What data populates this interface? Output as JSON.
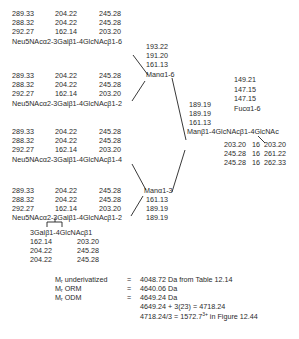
{
  "antennae": [
    {
      "rows": [
        [
          "289.33",
          "204.22",
          "245.28"
        ],
        [
          "288.32",
          "204.22",
          "245.28"
        ],
        [
          "292.27",
          "162.14",
          "203.20"
        ]
      ],
      "label": "Neu5NAcα2-3Galβ1-4GlcNAcβ1-6"
    },
    {
      "rows": [
        [
          "289.33",
          "204.22",
          "245.28"
        ],
        [
          "288.32",
          "204.22",
          "245.28"
        ],
        [
          "292.27",
          "162.14",
          "203.20"
        ]
      ],
      "label": "Neu5NAcα2-3Galβ1-4GlcNAcβ1-2"
    },
    {
      "rows": [
        [
          "289.33",
          "204.22",
          "245.28"
        ],
        [
          "288.32",
          "204.22",
          "245.28"
        ],
        [
          "292.27",
          "162.14",
          "203.20"
        ]
      ],
      "label": "Neu5NAcα2-3Galβ1-4GlcNAcβ1-4"
    },
    {
      "rows": [
        [
          "289.33",
          "204.22",
          "245.28"
        ],
        [
          "288.32",
          "204.22",
          "245.28"
        ],
        [
          "292.27",
          "162.14",
          "203.20"
        ]
      ],
      "label": "Neu5NAcα2-3Galβ1-4GlcNAcβ1-2"
    }
  ],
  "branch_upper": {
    "values": [
      "193.22",
      "191.20",
      "161.13"
    ],
    "label": "Manα1-6"
  },
  "branch_lower": {
    "label": "Manα1-3",
    "values": [
      "161.13",
      "189.19",
      "189.19"
    ]
  },
  "core": {
    "values": [
      "189.19",
      "189.19",
      "161.13"
    ],
    "label": "Manβ1-4GlcNAcβ1-4GlcNAc",
    "fucose": {
      "values": [
        "149.21",
        "147.15",
        "147.15"
      ],
      "label": "Fucα1-6"
    },
    "bottom_rows": [
      [
        "203.20",
        "16",
        "203.20"
      ],
      [
        "245.28",
        "16",
        "261.22"
      ],
      [
        "245.28",
        "16",
        "262.33"
      ]
    ]
  },
  "lacnac_extension": {
    "label": "3Galβ1-4GlcNAcβ1",
    "rows": [
      [
        "162.14",
        "203.20"
      ],
      [
        "204.22",
        "245.28"
      ],
      [
        "204.22",
        "245.28"
      ]
    ]
  },
  "masses": [
    {
      "label_main": "M",
      "label_sub": "r",
      "label_rest": " underivatized",
      "eq": "=",
      "value": "4048.72 Da from Table 12.14"
    },
    {
      "label_main": "M",
      "label_sub": "r",
      "label_rest": " ORM",
      "eq": "=",
      "value": "4640.06 Da"
    },
    {
      "label_main": "M",
      "label_sub": "r",
      "label_rest": " ODM",
      "eq": "=",
      "value": "4649.24 Da"
    }
  ],
  "calc_lines": {
    "line1": "4649.24 + 3(23) = 4718.24",
    "line2_pre": "4718.24/3 = 1572.7",
    "line2_sup": "3+",
    "line2_post": " in Figure 12.44"
  }
}
